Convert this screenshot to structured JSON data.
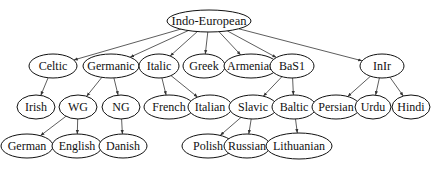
{
  "diagram": {
    "root": "indo-european",
    "nodes": [
      {
        "id": "indo-european",
        "label": "Indo-European",
        "cx": 209,
        "cy": 21,
        "rx": 42,
        "ry": 11
      },
      {
        "id": "celtic",
        "label": "Celtic",
        "cx": 53,
        "cy": 66,
        "rx": 24,
        "ry": 12
      },
      {
        "id": "germanic",
        "label": "Germanic",
        "cx": 111,
        "cy": 66,
        "rx": 28,
        "ry": 12
      },
      {
        "id": "italic",
        "label": "Italic",
        "cx": 159,
        "cy": 66,
        "rx": 20,
        "ry": 12
      },
      {
        "id": "greek",
        "label": "Greek",
        "cx": 204,
        "cy": 66,
        "rx": 21,
        "ry": 12
      },
      {
        "id": "armenian",
        "label": "Armenian",
        "cx": 251,
        "cy": 66,
        "rx": 27,
        "ry": 12
      },
      {
        "id": "basl",
        "label": "BaS1",
        "cx": 292,
        "cy": 66,
        "rx": 22,
        "ry": 12
      },
      {
        "id": "inir",
        "label": "InIr",
        "cx": 382,
        "cy": 66,
        "rx": 22,
        "ry": 12
      },
      {
        "id": "irish",
        "label": "Irish",
        "cx": 36,
        "cy": 107,
        "rx": 19,
        "ry": 12
      },
      {
        "id": "wg",
        "label": "WG",
        "cx": 78,
        "cy": 107,
        "rx": 19,
        "ry": 12
      },
      {
        "id": "ng",
        "label": "NG",
        "cx": 121,
        "cy": 107,
        "rx": 19,
        "ry": 12
      },
      {
        "id": "french",
        "label": "French",
        "cx": 169,
        "cy": 107,
        "rx": 25,
        "ry": 12
      },
      {
        "id": "italian",
        "label": "Italian",
        "cx": 210,
        "cy": 107,
        "rx": 22,
        "ry": 12
      },
      {
        "id": "slavic",
        "label": "Slavic",
        "cx": 253,
        "cy": 107,
        "rx": 24,
        "ry": 12
      },
      {
        "id": "baltic",
        "label": "Baltic",
        "cx": 294,
        "cy": 107,
        "rx": 22,
        "ry": 12
      },
      {
        "id": "persian",
        "label": "Persian",
        "cx": 336,
        "cy": 107,
        "rx": 24,
        "ry": 12
      },
      {
        "id": "urdu",
        "label": "Urdu",
        "cx": 373,
        "cy": 107,
        "rx": 18,
        "ry": 12
      },
      {
        "id": "hindi",
        "label": "Hindi",
        "cx": 411,
        "cy": 107,
        "rx": 19,
        "ry": 12
      },
      {
        "id": "german",
        "label": "German",
        "cx": 27,
        "cy": 146,
        "rx": 26,
        "ry": 12
      },
      {
        "id": "english",
        "label": "English",
        "cx": 77,
        "cy": 146,
        "rx": 25,
        "ry": 12
      },
      {
        "id": "danish",
        "label": "Danish",
        "cx": 123,
        "cy": 146,
        "rx": 24,
        "ry": 12
      },
      {
        "id": "polish",
        "label": "Polish",
        "cx": 208,
        "cy": 146,
        "rx": 26,
        "ry": 12
      },
      {
        "id": "russian",
        "label": "Russian",
        "cx": 247,
        "cy": 146,
        "rx": 23,
        "ry": 12
      },
      {
        "id": "lithuanian",
        "label": "Lithuanian",
        "cx": 299,
        "cy": 146,
        "rx": 33,
        "ry": 13
      }
    ],
    "edges": [
      [
        "indo-european",
        "celtic"
      ],
      [
        "indo-european",
        "germanic"
      ],
      [
        "indo-european",
        "italic"
      ],
      [
        "indo-european",
        "greek"
      ],
      [
        "indo-european",
        "armenian"
      ],
      [
        "indo-european",
        "basl"
      ],
      [
        "indo-european",
        "inir"
      ],
      [
        "celtic",
        "irish"
      ],
      [
        "germanic",
        "wg"
      ],
      [
        "germanic",
        "ng"
      ],
      [
        "italic",
        "french"
      ],
      [
        "italic",
        "italian"
      ],
      [
        "basl",
        "slavic"
      ],
      [
        "basl",
        "baltic"
      ],
      [
        "inir",
        "persian"
      ],
      [
        "inir",
        "urdu"
      ],
      [
        "inir",
        "hindi"
      ],
      [
        "wg",
        "german"
      ],
      [
        "wg",
        "english"
      ],
      [
        "ng",
        "danish"
      ],
      [
        "slavic",
        "polish"
      ],
      [
        "slavic",
        "russian"
      ],
      [
        "baltic",
        "lithuanian"
      ]
    ]
  }
}
